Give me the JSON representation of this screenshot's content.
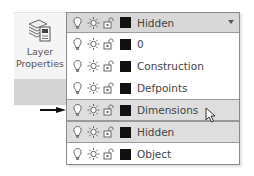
{
  "ribbon": {
    "layer_properties": {
      "label_line1": "Layer",
      "label_line2": "Properties",
      "icon": "layer-stack-icon"
    }
  },
  "layer_dropdown": {
    "current": {
      "name": "Hidden",
      "icons": [
        "lightbulb-icon",
        "sun-icon",
        "unlock-icon"
      ],
      "color": "#111111"
    },
    "items": [
      {
        "name": "0",
        "color": "#111111",
        "highlighted": false
      },
      {
        "name": "Construction",
        "color": "#111111",
        "highlighted": false
      },
      {
        "name": "Defpoints",
        "color": "#111111",
        "highlighted": false
      },
      {
        "name": "Dimensions",
        "color": "#111111",
        "highlighted": true,
        "hovered": true
      },
      {
        "name": "Hidden",
        "color": "#111111",
        "highlighted": true
      },
      {
        "name": "Object",
        "color": "#111111",
        "highlighted": false
      }
    ],
    "caret_icon": "chevron-down-icon"
  },
  "annotation": {
    "arrow_target": "Dimensions"
  },
  "colors": {
    "highlight": "#dedede",
    "combo_bg": "#d8d8d8",
    "border": "#8a8a8a"
  }
}
